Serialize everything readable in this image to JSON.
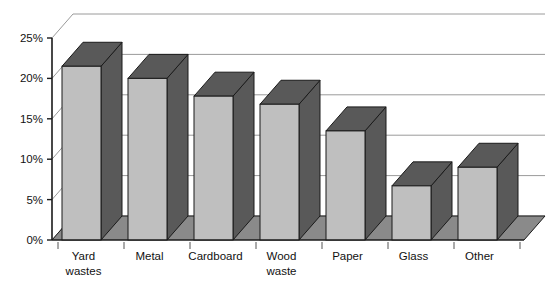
{
  "chart_data": {
    "type": "bar",
    "title": "",
    "subtitle": "",
    "xlabel": "",
    "ylabel": "",
    "categories": [
      "Yard wastes",
      "Metal",
      "Cardboard",
      "Wood waste",
      "Paper",
      "Glass",
      "Other"
    ],
    "category_lines": [
      [
        "Yard",
        "wastes"
      ],
      [
        "Metal"
      ],
      [
        "Cardboard"
      ],
      [
        "Wood",
        "waste"
      ],
      [
        "Paper"
      ],
      [
        "Glass"
      ],
      [
        "Other"
      ]
    ],
    "values": [
      21.5,
      20.0,
      17.8,
      16.8,
      13.5,
      6.7,
      9.0
    ],
    "value_labels": [
      "21.5%",
      "20.0%",
      "17.8%",
      "16.8%",
      "13.5%",
      "6.7%",
      "9.0%"
    ],
    "ylim": [
      0,
      25
    ],
    "ytick_values": [
      0,
      5,
      10,
      15,
      20,
      25
    ],
    "ytick_labels": [
      "0%",
      "5%",
      "10%",
      "15%",
      "20%",
      "25%"
    ],
    "grid": true,
    "grid_axis": "y",
    "legend": false,
    "legend_position": "none",
    "style": "3d-column",
    "series": [
      {
        "name": "Share of waste stream",
        "values": [
          21.5,
          20.0,
          17.8,
          16.8,
          13.5,
          6.7,
          9.0
        ]
      }
    ]
  },
  "colors": {
    "bar_front": "#bfbfbf",
    "bar_top": "#595959",
    "bar_side": "#595959",
    "bar_outline": "#1a1a1a",
    "floor": "#8a8a8a",
    "floor_outline": "#1a1a1a",
    "wall_background": "#ffffff",
    "gridline": "#9a9a9a",
    "axis": "#1a1a1a",
    "text": "#111111",
    "page_background": "#ffffff"
  },
  "geometry": {
    "axis_x": 52,
    "baseline_y": 240,
    "top_y": 38,
    "depth_dx": 21,
    "depth_dy": -24,
    "plot_right_x": 524,
    "bar_width": 39,
    "bar_gap_pitch": 66,
    "first_bar_x": 62
  }
}
